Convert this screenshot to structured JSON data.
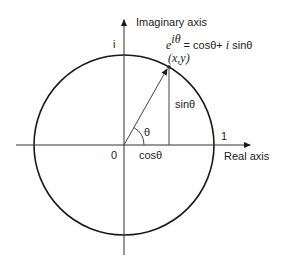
{
  "diagram": {
    "labels": {
      "imaginary_axis": "Imaginary axis",
      "real_axis": "Real axis",
      "i_tick": "i",
      "one_tick": "1",
      "origin": "0",
      "theta": "θ",
      "cos": "cosθ",
      "sin": "sinθ",
      "point": "(x,y)",
      "formula_base": "e",
      "formula_exp": "iθ",
      "formula_rhs_1": " = cosθ+ ",
      "formula_i": "i",
      "formula_rhs_2": " sinθ"
    },
    "colors": {
      "stroke": "#1a1a1a",
      "text": "#222222",
      "background": "#ffffff"
    }
  }
}
